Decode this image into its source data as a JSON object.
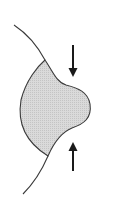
{
  "diagram": {
    "colors": {
      "fill": "#d6d6d6",
      "stroke": "#3a3a3a",
      "arrow": "#1a1a1a",
      "background": "#ffffff"
    },
    "elements": [
      {
        "type": "boundary-curve",
        "label": ""
      },
      {
        "type": "shaded-protrusion",
        "label": ""
      },
      {
        "type": "arrow",
        "direction": "down",
        "label": ""
      },
      {
        "type": "arrow",
        "direction": "up",
        "label": ""
      }
    ]
  }
}
